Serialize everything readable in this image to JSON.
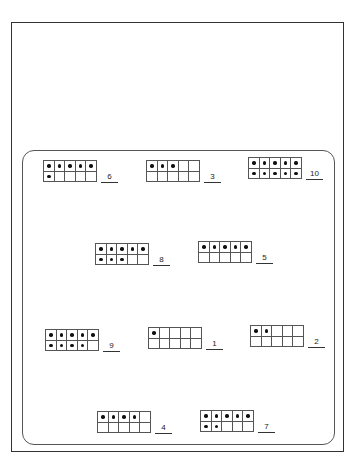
{
  "worksheet": {
    "title": "",
    "ten_frames": [
      {
        "id": "frame-6",
        "dots": 6,
        "answer": "6",
        "x": 43,
        "y": 160
      },
      {
        "id": "frame-3",
        "dots": 3,
        "answer": "3",
        "x": 146,
        "y": 160
      },
      {
        "id": "frame-10",
        "dots": 10,
        "answer": "10",
        "x": 248,
        "y": 157
      },
      {
        "id": "frame-8",
        "dots": 8,
        "answer": "8",
        "x": 95,
        "y": 243
      },
      {
        "id": "frame-5",
        "dots": 5,
        "answer": "5",
        "x": 198,
        "y": 241
      },
      {
        "id": "frame-9",
        "dots": 9,
        "answer": "9",
        "x": 45,
        "y": 329
      },
      {
        "id": "frame-1",
        "dots": 1,
        "answer": "1",
        "x": 148,
        "y": 327
      },
      {
        "id": "frame-2",
        "dots": 2,
        "answer": "2",
        "x": 250,
        "y": 325
      },
      {
        "id": "frame-4",
        "dots": 4,
        "answer": "4",
        "x": 97,
        "y": 411
      },
      {
        "id": "frame-7",
        "dots": 7,
        "answer": "7",
        "x": 200,
        "y": 410
      }
    ]
  },
  "colors": {
    "line": "#555555",
    "dot": "#111111",
    "background": "#ffffff"
  }
}
